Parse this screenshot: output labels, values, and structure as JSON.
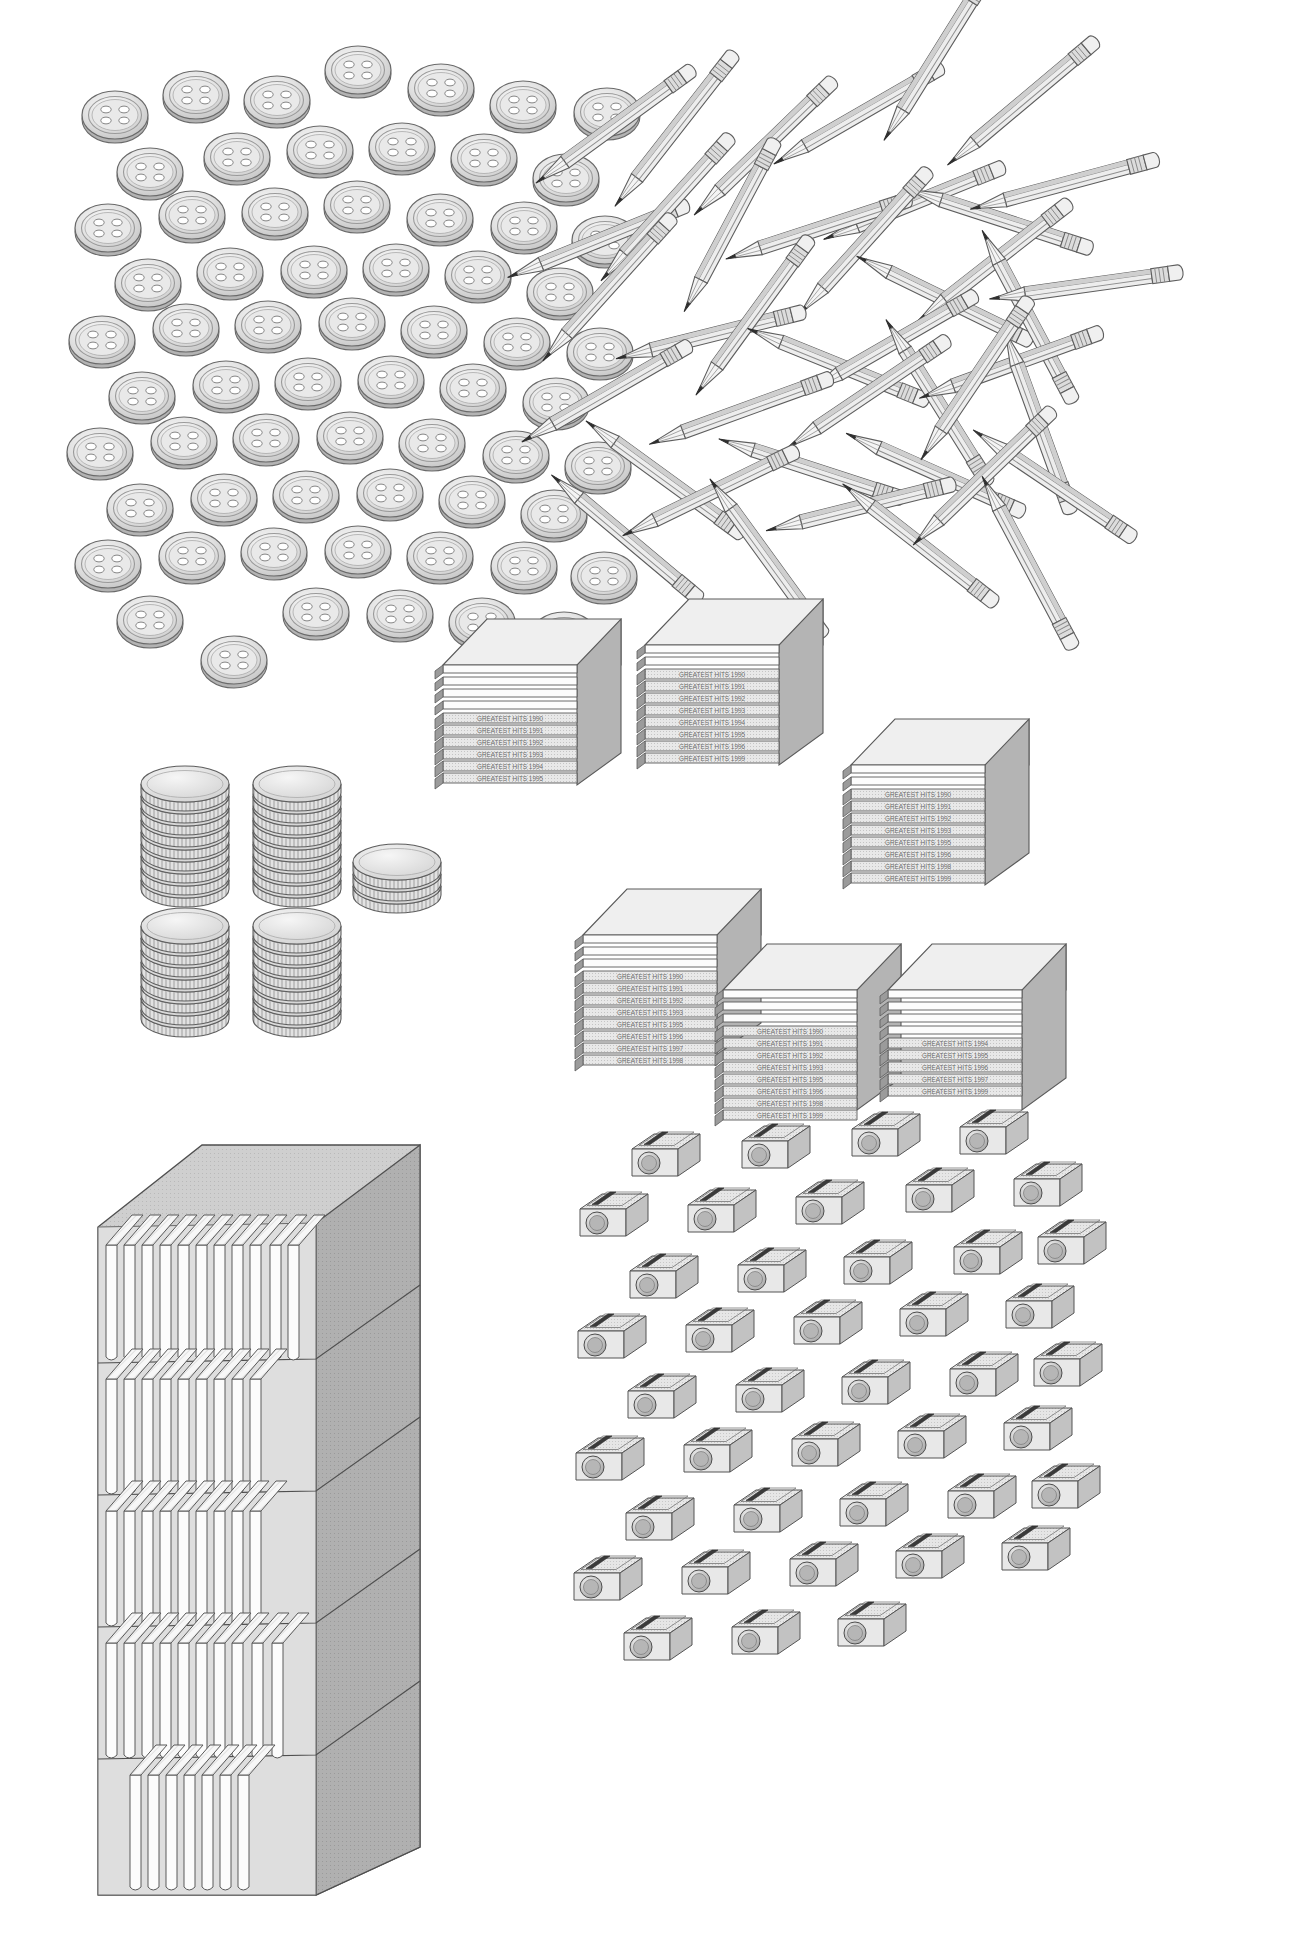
{
  "page": {
    "background_color": "#ffffff",
    "width": 1306,
    "height": 1933,
    "style": "grayscale line-art with halftone shading"
  },
  "palette": {
    "outline": "#5a5a5a",
    "outline_dark": "#3d3d3d",
    "fill_light": "#f2f2f2",
    "fill_mid": "#d6d6d6",
    "fill_shadow": "#b8b8b8",
    "fill_dark": "#9a9a9a",
    "white": "#ffffff",
    "label_text": "#6b6b6b"
  },
  "groups": [
    {
      "id": "buttons",
      "name": "Scattered shirt buttons",
      "object": "button",
      "count": 63,
      "description": "Four-hole round sew-through buttons scattered in a loose grid",
      "position": {
        "x": 55,
        "y": 45,
        "w": 520,
        "h": 530
      }
    },
    {
      "id": "pencils",
      "name": "Scattered pencils",
      "object": "pencil",
      "count": 41,
      "description": "Sharpened hexagonal pencils with erasers and metal ferrules, randomly oriented",
      "position": {
        "x": 520,
        "y": 60,
        "w": 540,
        "h": 490
      }
    },
    {
      "id": "coins",
      "name": "Stacks of coins",
      "object": "coin",
      "stacks": [
        {
          "label": "back-left stack",
          "coins": 9
        },
        {
          "label": "back-right stack",
          "coins": 9
        },
        {
          "label": "front-left stack",
          "coins": 8
        },
        {
          "label": "front-right stack",
          "coins": 8
        },
        {
          "label": "small side stack",
          "coins": 3
        }
      ],
      "count": 37,
      "position": {
        "x": 120,
        "y": 640,
        "w": 280,
        "h": 260
      }
    },
    {
      "id": "cds",
      "name": "Stacks of CD jewel cases",
      "object": "cd-jewel-case",
      "stack_count": 5,
      "cases_per_stack": 10,
      "count": 50,
      "spine_label_prefix": "GREATEST HITS",
      "spine_labels": [
        "GREATEST HITS 1990",
        "GREATEST HITS 1991",
        "GREATEST HITS 1992",
        "GREATEST HITS 1993",
        "GREATEST HITS 1994",
        "GREATEST HITS 1995",
        "GREATEST HITS 1996",
        "GREATEST HITS 1997",
        "GREATEST HITS 1998",
        "GREATEST HITS 1999"
      ],
      "position": {
        "x": 420,
        "y": 575,
        "w": 620,
        "h": 530
      }
    },
    {
      "id": "books",
      "name": "Bookcase of books",
      "object": "book",
      "shelves": 5,
      "books_per_shelf": [
        11,
        9,
        9,
        10,
        7
      ],
      "count": 46,
      "description": "Tall grey bookcase seen in three-quarter view with white books standing on five shelves",
      "position": {
        "x": 95,
        "y": 1115,
        "w": 320,
        "h": 775
      }
    },
    {
      "id": "sharpeners",
      "name": "Scattered pencil sharpeners",
      "object": "pencil-sharpener",
      "count": 42,
      "description": "Rectangular block sharpeners with round entry hole and diagonal blade, arranged in staggered rows",
      "position": {
        "x": 585,
        "y": 1120,
        "w": 470,
        "h": 560
      }
    }
  ]
}
